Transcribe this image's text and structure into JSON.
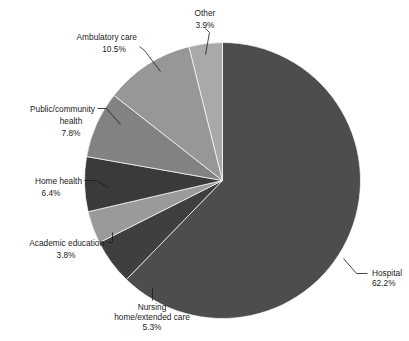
{
  "chart_data": {
    "type": "pie",
    "title": "",
    "subtitle": "",
    "xlabel": "",
    "ylabel": "",
    "legend_position": "none",
    "grid": false,
    "start_angle_deg": 0,
    "direction": "clockwise",
    "units": "percent",
    "total": 99.9,
    "categories": [
      "Hospital",
      "Nursing home/extended care",
      "Academic education",
      "Home health",
      "Public/community health",
      "Ambulatory care",
      "Other"
    ],
    "values": [
      62.2,
      5.3,
      3.8,
      6.4,
      7.8,
      10.5,
      3.9
    ],
    "slices": [
      {
        "label": "Hospital",
        "label_line1": "Hospital",
        "value": 62.2,
        "value_text": "62.2%",
        "color": "#4d4d4d",
        "label_position": "right"
      },
      {
        "label": "Nursing home/extended care",
        "label_line1": "Nursing",
        "label_line2": "home/extended care",
        "value": 5.3,
        "value_text": "5.3%",
        "color": "#3f3f3f",
        "label_position": "bottom"
      },
      {
        "label": "Academic education",
        "label_line1": "Academic education",
        "value": 3.8,
        "value_text": "3.8%",
        "color": "#9a9a9a",
        "label_position": "bottom-left"
      },
      {
        "label": "Home health",
        "label_line1": "Home health",
        "value": 6.4,
        "value_text": "6.4%",
        "color": "#3a3a3a",
        "label_position": "left"
      },
      {
        "label": "Public/community health",
        "label_line1": "Public/community",
        "label_line2": "health",
        "value": 7.8,
        "value_text": "7.8%",
        "color": "#828282",
        "label_position": "upper-left"
      },
      {
        "label": "Ambulatory care",
        "label_line1": "Ambulatory care",
        "value": 10.5,
        "value_text": "10.5%",
        "color": "#979797",
        "label_position": "top-left"
      },
      {
        "label": "Other",
        "label_line1": "Other",
        "value": 3.9,
        "value_text": "3.9%",
        "color": "#a9a9a9",
        "label_position": "top"
      }
    ]
  }
}
